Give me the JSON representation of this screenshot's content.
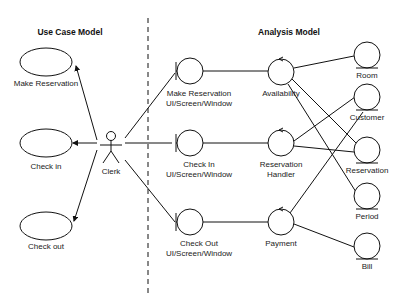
{
  "sections": {
    "left_title": "Use Case Model",
    "right_title": "Analysis Model"
  },
  "actor": {
    "label": "Clerk"
  },
  "use_cases": [
    {
      "label": "Make Reservation"
    },
    {
      "label": "Check in"
    },
    {
      "label": "Check out"
    }
  ],
  "boundaries": [
    {
      "line1": "Make Reservation",
      "line2": "UI/Screen/Window"
    },
    {
      "line1": "Check In",
      "line2": "UI/Screen/Window"
    },
    {
      "line1": "Check Out",
      "line2": "UI/Screen/Window"
    }
  ],
  "controls": [
    {
      "line1": "Availability",
      "line2": ""
    },
    {
      "line1": "Reservation",
      "line2": "Handler"
    },
    {
      "line1": "Payment",
      "line2": ""
    }
  ],
  "entities": [
    {
      "label": "Room"
    },
    {
      "label": "Customer"
    },
    {
      "label": "Reservation"
    },
    {
      "label": "Period"
    },
    {
      "label": "Bill"
    }
  ],
  "connections": [
    {
      "from": "Clerk",
      "to": "Make Reservation",
      "type": "association-arrow"
    },
    {
      "from": "Clerk",
      "to": "Check in",
      "type": "association-arrow"
    },
    {
      "from": "Clerk",
      "to": "Check out",
      "type": "association-arrow"
    },
    {
      "from": "Clerk",
      "to": "Make Reservation UI/Screen/Window",
      "type": "association"
    },
    {
      "from": "Clerk",
      "to": "Check In UI/Screen/Window",
      "type": "association"
    },
    {
      "from": "Clerk",
      "to": "Check Out UI/Screen/Window",
      "type": "association"
    },
    {
      "from": "Make Reservation UI/Screen/Window",
      "to": "Availability",
      "type": "association"
    },
    {
      "from": "Check In UI/Screen/Window",
      "to": "Reservation Handler",
      "type": "association"
    },
    {
      "from": "Check Out UI/Screen/Window",
      "to": "Payment",
      "type": "association"
    },
    {
      "from": "Availability",
      "to": "Room",
      "type": "association"
    },
    {
      "from": "Availability",
      "to": "Reservation",
      "type": "association"
    },
    {
      "from": "Availability",
      "to": "Period",
      "type": "association"
    },
    {
      "from": "Reservation Handler",
      "to": "Customer",
      "type": "association"
    },
    {
      "from": "Reservation Handler",
      "to": "Reservation",
      "type": "association"
    },
    {
      "from": "Payment",
      "to": "Customer",
      "type": "association"
    },
    {
      "from": "Payment",
      "to": "Bill",
      "type": "association"
    }
  ]
}
